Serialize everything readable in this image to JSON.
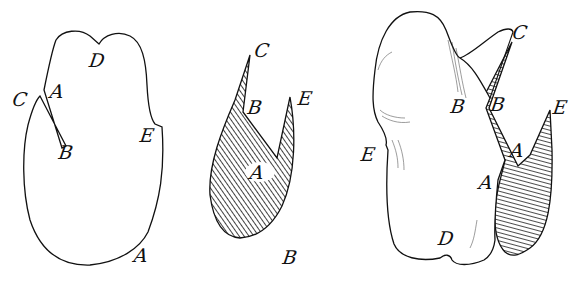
{
  "diagram": {
    "background": "#ffffff",
    "ink_color": "#111111",
    "figures": [
      {
        "id": "figure-1",
        "description": "outline shape with narrow slit from C/A to B",
        "labels": [
          {
            "text": "C",
            "x": 20,
            "y": 99
          },
          {
            "text": "A",
            "x": 57,
            "y": 91
          },
          {
            "text": "D",
            "x": 97,
            "y": 60
          },
          {
            "text": "B",
            "x": 66,
            "y": 152
          },
          {
            "text": "E",
            "x": 147,
            "y": 135
          },
          {
            "text": "A",
            "x": 141,
            "y": 255
          }
        ]
      },
      {
        "id": "figure-2",
        "description": "hatched cut-out piece",
        "labels": [
          {
            "text": "C",
            "x": 262,
            "y": 50
          },
          {
            "text": "B",
            "x": 255,
            "y": 107
          },
          {
            "text": "E",
            "x": 305,
            "y": 98
          },
          {
            "text": "A",
            "x": 257,
            "y": 172
          },
          {
            "text": "B",
            "x": 290,
            "y": 257
          }
        ]
      },
      {
        "id": "figure-3",
        "description": "folded shape with hatched piece inserted",
        "labels": [
          {
            "text": "C",
            "x": 520,
            "y": 32
          },
          {
            "text": "B",
            "x": 458,
            "y": 106
          },
          {
            "text": "B",
            "x": 498,
            "y": 104
          },
          {
            "text": "E",
            "x": 560,
            "y": 107
          },
          {
            "text": "E",
            "x": 368,
            "y": 154
          },
          {
            "text": "A",
            "x": 517,
            "y": 150
          },
          {
            "text": "A",
            "x": 486,
            "y": 182
          },
          {
            "text": "D",
            "x": 446,
            "y": 238
          }
        ]
      }
    ]
  }
}
